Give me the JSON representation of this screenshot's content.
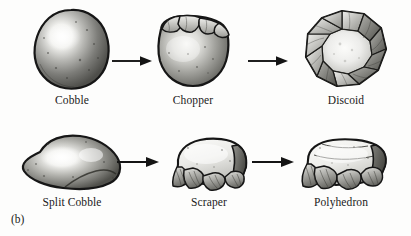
{
  "figure": {
    "panel_tag": "(b)",
    "rows": [
      {
        "row_name": "chopper-discoid-sequence",
        "items": [
          {
            "label": "Cobble",
            "icon": "cobble-stone-icon"
          },
          {
            "label": "Chopper",
            "icon": "chopper-stone-icon"
          },
          {
            "label": "Discoid",
            "icon": "discoid-stone-icon"
          }
        ],
        "arrows": [
          {
            "name": "arrow-cobble-to-chopper"
          },
          {
            "name": "arrow-chopper-to-discoid"
          }
        ]
      },
      {
        "row_name": "scraper-polyhedron-sequence",
        "items": [
          {
            "label": "Split Cobble",
            "icon": "split-cobble-stone-icon"
          },
          {
            "label": "Scraper",
            "icon": "scraper-stone-icon"
          },
          {
            "label": "Polyhedron",
            "icon": "polyhedron-stone-icon"
          }
        ],
        "arrows": [
          {
            "name": "arrow-split-cobble-to-scraper"
          },
          {
            "name": "arrow-scraper-to-polyhedron"
          }
        ]
      }
    ],
    "colors": {
      "background": "#fdfdfc",
      "ink": "#1a1a1a",
      "stone_outline": "#171717",
      "stone_dark": "#4a4a4a",
      "stone_mid": "#8c8c8c",
      "stone_light": "#e8e8e6",
      "stone_highlight": "#fbfbf9"
    }
  }
}
